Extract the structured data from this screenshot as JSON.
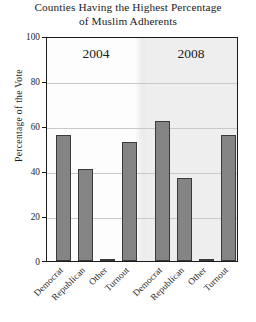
{
  "chart_data": {
    "type": "bar",
    "title": "Counties Having the Highest Percentage of Muslim Adherents",
    "title_line1": "Counties Having the Highest Percentage",
    "title_line2": "of Muslim Adherents",
    "xlabel": "",
    "ylabel": "Percentage of the Vote",
    "ylim": [
      0,
      100
    ],
    "yticks": [
      "0",
      "20",
      "40",
      "60",
      "80",
      "100"
    ],
    "ytick_values": [
      0,
      20,
      40,
      60,
      80,
      100
    ],
    "grid": true,
    "legend": "none",
    "panels": [
      {
        "label": "2004",
        "categories": [
          "Democrat",
          "Republican",
          "Other",
          "Turnout"
        ],
        "values": [
          56,
          41,
          1,
          53
        ]
      },
      {
        "label": "2008",
        "categories": [
          "Democrat",
          "Republican",
          "Other",
          "Turnout"
        ],
        "values": [
          62,
          37,
          1,
          56
        ]
      }
    ],
    "colors": {
      "bar_fill": "#848484",
      "bar_edge": "#3a3a3a",
      "panel_left_bg": "#fdfdfd",
      "panel_right_bg": "#eeeeee",
      "gridline": "#c9c9c9",
      "axis": "#1a1a1a",
      "text": "#1c1c1c"
    }
  }
}
